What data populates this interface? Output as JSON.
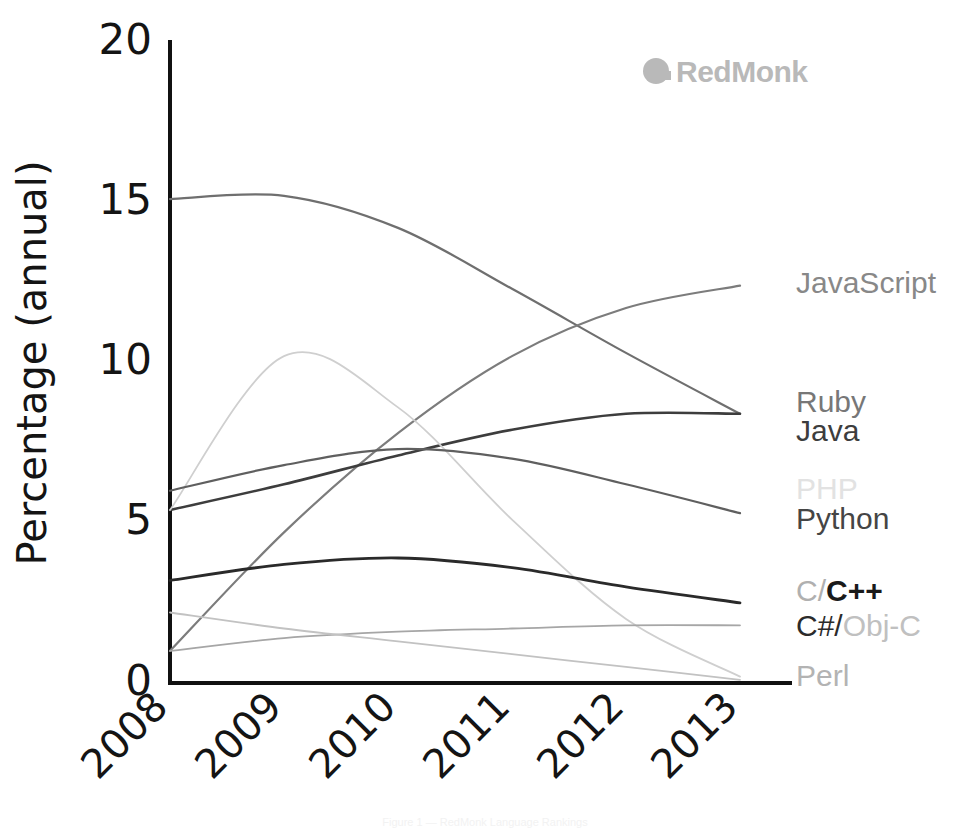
{
  "watermark": {
    "label": "RedMonk",
    "color": "#b9b9b9",
    "icon": "redmonk-logo-icon"
  },
  "caption": {
    "text": "Figure 1 — RedMonk Language Rankings"
  },
  "axes": {
    "ylabel": "Percentage (annual)",
    "yticks": [
      "0",
      "5",
      "10",
      "15",
      "20"
    ],
    "xticks": [
      "2008",
      "2009",
      "2010",
      "2011",
      "2012",
      "2013"
    ],
    "xlabel": ""
  },
  "chart_data": {
    "type": "line",
    "title": "",
    "xlabel": "",
    "ylabel": "Percentage (annual)",
    "x": [
      2008,
      2009,
      2010,
      2011,
      2012,
      2013
    ],
    "xlim": [
      2008,
      2013
    ],
    "ylim": [
      0,
      20
    ],
    "yticks": [
      0,
      5,
      10,
      15,
      20
    ],
    "grid": false,
    "legend_position": "right-inline-labels",
    "series": [
      {
        "name": "Ruby",
        "color": "#6f6f6f",
        "width": 2.2,
        "values": [
          15.1,
          15.2,
          14.2,
          12.3,
          10.3,
          8.4
        ]
      },
      {
        "name": "JavaScript",
        "color": "#7c7c7c",
        "width": 2.2,
        "values": [
          1.0,
          4.7,
          7.8,
          10.2,
          11.7,
          12.4
        ]
      },
      {
        "name": "Java",
        "color": "#3d3d3d",
        "width": 2.6,
        "values": [
          5.4,
          6.2,
          7.1,
          7.9,
          8.4,
          8.4
        ]
      },
      {
        "name": "PHP",
        "color": "#cfcfcf",
        "width": 1.8,
        "values": [
          5.4,
          10.2,
          8.6,
          5.1,
          2.0,
          0.2
        ]
      },
      {
        "name": "Python",
        "color": "#5f5f5f",
        "width": 2.2,
        "values": [
          6.0,
          6.8,
          7.3,
          7.0,
          6.2,
          5.3
        ]
      },
      {
        "name": "C/C++",
        "color": "#2a2a2a",
        "width": 2.8,
        "values": [
          3.2,
          3.7,
          3.9,
          3.6,
          3.0,
          2.5
        ]
      },
      {
        "name": "C#/Obj-C",
        "color": "#a6a6a6",
        "width": 1.8,
        "values": [
          1.0,
          1.4,
          1.6,
          1.7,
          1.8,
          1.8
        ]
      },
      {
        "name": "Perl",
        "color": "#c2c2c2",
        "width": 1.8,
        "values": [
          2.2,
          1.7,
          1.3,
          0.9,
          0.5,
          0.1
        ]
      }
    ]
  },
  "legend": [
    {
      "id": "javascript",
      "label": "JavaScript",
      "y": 285,
      "parts": [
        {
          "text": "JavaScript",
          "color": "#888888",
          "bold": false
        }
      ]
    },
    {
      "id": "ruby",
      "label": "Ruby",
      "y": 404,
      "parts": [
        {
          "text": "Ruby",
          "color": "#777777",
          "bold": false
        }
      ]
    },
    {
      "id": "java",
      "label": "Java",
      "y": 433,
      "parts": [
        {
          "text": "Java",
          "color": "#3d3d3d",
          "bold": false
        }
      ]
    },
    {
      "id": "php",
      "label": "PHP",
      "y": 491,
      "parts": [
        {
          "text": "PHP",
          "color": "#e2e2e2",
          "bold": false
        }
      ]
    },
    {
      "id": "python",
      "label": "Python",
      "y": 521,
      "parts": [
        {
          "text": "Python",
          "color": "#454545",
          "bold": false
        }
      ]
    },
    {
      "id": "ccpp",
      "label": "C/C++",
      "y": 593,
      "parts": [
        {
          "text": "C/",
          "color": "#b0b0b0",
          "bold": false
        },
        {
          "text": "C++",
          "color": "#1a1a1a",
          "bold": true
        }
      ]
    },
    {
      "id": "csharp",
      "label": "C#/Obj-C",
      "y": 628,
      "parts": [
        {
          "text": "C#/",
          "color": "#2b2b2b",
          "bold": false
        },
        {
          "text": "Obj-C",
          "color": "#c0c0c0",
          "bold": false
        }
      ]
    },
    {
      "id": "perl",
      "label": "Perl",
      "y": 678,
      "parts": [
        {
          "text": "Perl",
          "color": "#b3b3b3",
          "bold": false
        }
      ]
    }
  ]
}
